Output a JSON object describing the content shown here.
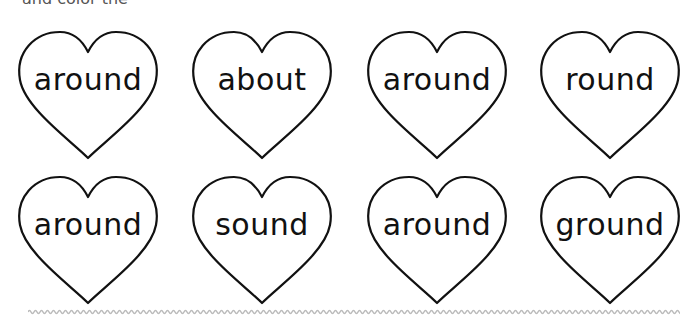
{
  "top_text_cut": "and color the",
  "hearts": [
    {
      "word": "around",
      "x": 15,
      "y": 28
    },
    {
      "word": "about",
      "x": 189,
      "y": 28
    },
    {
      "word": "around",
      "x": 364,
      "y": 28
    },
    {
      "word": "round",
      "x": 537,
      "y": 28
    },
    {
      "word": "around",
      "x": 15,
      "y": 173
    },
    {
      "word": "sound",
      "x": 189,
      "y": 173
    },
    {
      "word": "around",
      "x": 364,
      "y": 173
    },
    {
      "word": "ground",
      "x": 537,
      "y": 173
    }
  ],
  "colors": {
    "outline": "#111111",
    "wavy_line": "#bbbbbb"
  }
}
